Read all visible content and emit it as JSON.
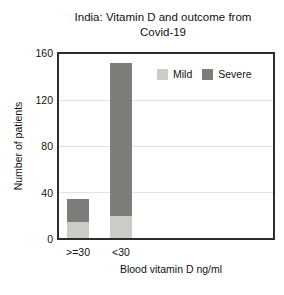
{
  "figure": {
    "title_line1": "India: Vitamin D and outcome from",
    "title_line2": "Covid-19"
  },
  "chart_data": {
    "type": "bar",
    "stacked": true,
    "title": "India: Vitamin D and outcome from Covid-19",
    "categories": [
      ">=30",
      "<30"
    ],
    "series": [
      {
        "name": "Mild",
        "color": "#c9cdc6",
        "values": [
          14,
          19
        ]
      },
      {
        "name": "Severe",
        "color": "#7b7e78",
        "values": [
          20,
          133
        ]
      }
    ],
    "xlabel": "Blood vitamin D ng/ml",
    "ylabel": "Number of patients",
    "ylim": [
      0,
      160
    ],
    "yticks": [
      0,
      40,
      80,
      120,
      160
    ],
    "grid": true,
    "legend_position": "top-right-inside",
    "colors": {
      "axis": "#2d2d2d",
      "gridline": "#e3e3e3",
      "background": "#ffffff",
      "text": "#111111"
    }
  }
}
